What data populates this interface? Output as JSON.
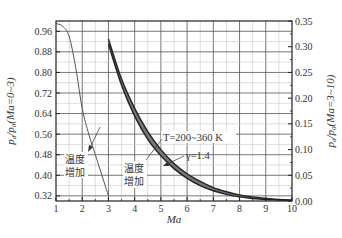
{
  "chart_data": {
    "type": "line",
    "title": "",
    "xlabel": "Ma",
    "ylabel_left": "p_d/p_0(Ma=0~3)",
    "ylabel_right": "p_d/p_0(Ma=3~10)",
    "xlim": [
      1,
      10
    ],
    "ylim_left": [
      0.3,
      1.0
    ],
    "ylim_right": [
      0.0,
      0.35
    ],
    "x_ticks": [
      "1",
      "2",
      "3",
      "4",
      "5",
      "6",
      "7",
      "8",
      "9",
      "10"
    ],
    "y_ticks_left": [
      "0.96",
      "0.88",
      "0.80",
      "0.72",
      "0.64",
      "0.56",
      "0.48",
      "0.40",
      "0.32"
    ],
    "y_ticks_right": [
      "0.35",
      "0.30",
      "0.25",
      "0.20",
      "0.15",
      "0.10",
      "0.05",
      "0.00"
    ],
    "grid": true,
    "series": [
      {
        "name": "p_d/p_0 (Ma=0~3)",
        "axis": "left",
        "style": "thin",
        "x": [
          1.0,
          1.25,
          1.5,
          1.75,
          2.0,
          2.25,
          2.5,
          2.75,
          3.0
        ],
        "y": [
          0.99,
          0.98,
          0.94,
          0.82,
          0.66,
          0.56,
          0.48,
          0.4,
          0.32
        ]
      },
      {
        "name": "p_d/p_0 (Ma=3~10), T=200~360 K band, lower bound",
        "axis": "right",
        "style": "band-edge",
        "x": [
          3.0,
          3.5,
          4.0,
          4.5,
          5.0,
          5.5,
          6.0,
          6.5,
          7.0,
          7.5,
          8.0,
          8.5,
          9.0,
          9.5,
          10.0
        ],
        "y": [
          0.305,
          0.225,
          0.165,
          0.12,
          0.088,
          0.063,
          0.044,
          0.03,
          0.02,
          0.013,
          0.008,
          0.005,
          0.003,
          0.002,
          0.001
        ]
      },
      {
        "name": "p_d/p_0 (Ma=3~10), T=200~360 K band, upper bound",
        "axis": "right",
        "style": "band-edge",
        "x": [
          3.0,
          3.5,
          4.0,
          4.5,
          5.0,
          5.5,
          6.0,
          6.5,
          7.0,
          7.5,
          8.0,
          8.5,
          9.0,
          9.5,
          10.0
        ],
        "y": [
          0.315,
          0.237,
          0.18,
          0.135,
          0.1,
          0.073,
          0.053,
          0.038,
          0.026,
          0.018,
          0.012,
          0.008,
          0.005,
          0.003,
          0.002
        ]
      }
    ],
    "annotations": [
      {
        "text": "T=200~360 K",
        "x": 5.6,
        "y_right": 0.14
      },
      {
        "text": "γ=1.4",
        "x": 6.2,
        "y_right": 0.09
      },
      {
        "text_line1": "温度",
        "text_line2": "增加",
        "x": 1.3,
        "y_left": 0.46
      },
      {
        "text_line1": "温度",
        "text_line2": "增加",
        "x": 3.8,
        "y_right": 0.07
      }
    ]
  },
  "labels": {
    "xlabel": "Ma",
    "ylabel_left_main": "p",
    "ylabel_left_sub1": "d",
    "ylabel_left_mid": "/p",
    "ylabel_left_sub2": "0",
    "ylabel_left_tail": "(Ma=0~3)",
    "ylabel_right_main": "p",
    "ylabel_right_sub1": "d",
    "ylabel_right_mid": "/p",
    "ylabel_right_sub2": "0",
    "ylabel_right_tail": "(Ma=3~10)",
    "anno_T": "T=200~360 K",
    "anno_gamma": "γ=1.4",
    "anno_temp_inc_1": "温度",
    "anno_temp_inc_2": "增加"
  }
}
